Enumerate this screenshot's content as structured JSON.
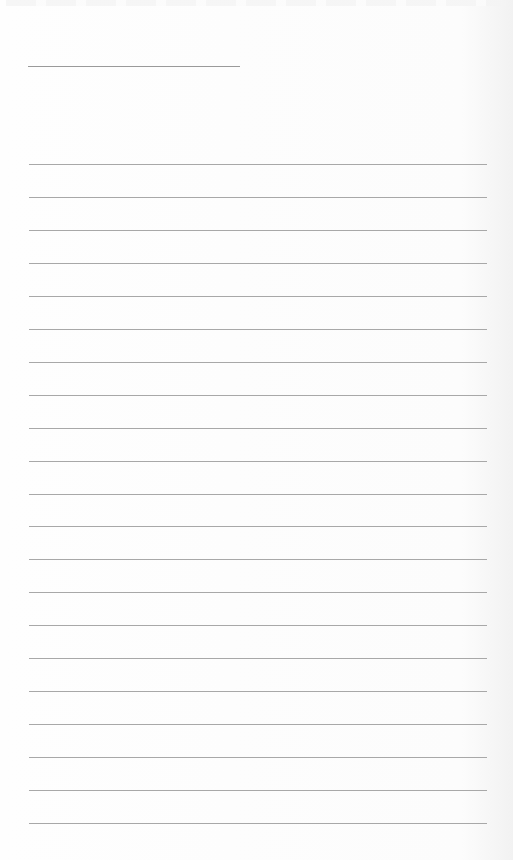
{
  "page": {
    "type": "lined-paper",
    "background_color": "#fdfdfd",
    "line_color": "#a8a8a8",
    "title_line": {
      "x": 28,
      "y": 66,
      "width": 212
    },
    "ruled_lines": {
      "count": 21,
      "start_y": 164,
      "spacing": 32.95,
      "x": 29,
      "width": 458
    }
  }
}
